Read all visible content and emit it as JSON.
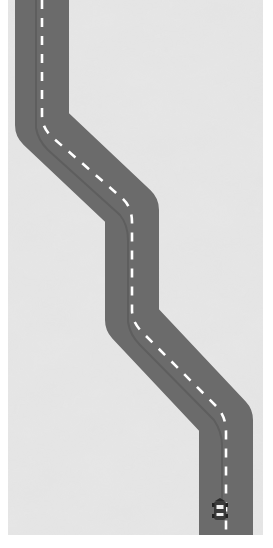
{
  "game": {
    "type": "top-down road racer",
    "canvas": {
      "x": 8,
      "y": 0,
      "width": 255,
      "height": 535
    },
    "colors": {
      "ground": "#d4d4d4",
      "ground_light": "#e8e8e8",
      "road": "#6b6b6b",
      "road_edge": "#5f5f5f",
      "lane_marking": "#ffffff",
      "tire_track": "#555555",
      "car_body": "#3a3a3a",
      "car_highlight": "#f2f2f2"
    },
    "road": {
      "width": 54,
      "centerline_points": [
        [
          34,
          0
        ],
        [
          34,
          125
        ],
        [
          124,
          210
        ],
        [
          124,
          320
        ],
        [
          218,
          420
        ],
        [
          218,
          535
        ]
      ],
      "lane_dash": "9 9"
    },
    "player_car": {
      "x": 212,
      "y": 510,
      "heading": "up"
    }
  }
}
